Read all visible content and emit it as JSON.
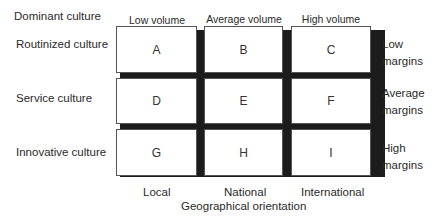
{
  "row_axis_title": "Dominant culture",
  "columns": [
    "Low volume",
    "Average volume",
    "High volume"
  ],
  "rows": [
    "Routinized culture",
    "Service culture",
    "Innovative culture"
  ],
  "margins": [
    [
      "Low",
      "margins"
    ],
    [
      "Average",
      "margins"
    ],
    [
      "High",
      "margins"
    ]
  ],
  "cells": [
    [
      "A",
      "B",
      "C"
    ],
    [
      "D",
      "E",
      "F"
    ],
    [
      "G",
      "H",
      "I"
    ]
  ],
  "geo_columns": [
    "Local",
    "National",
    "International"
  ],
  "geo_axis_title": "Geographical orientation"
}
